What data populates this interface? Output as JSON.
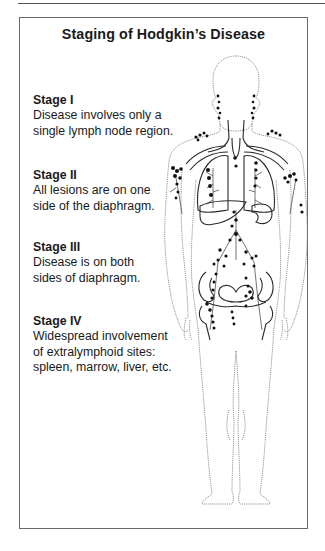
{
  "title": "Staging of Hodgkin’s Disease",
  "stages": [
    {
      "heading": "Stage I",
      "lines": [
        "Disease involves only a",
        "single lymph node region."
      ]
    },
    {
      "heading": "Stage II",
      "lines": [
        "All lesions are on one",
        "side of the diaphragm."
      ]
    },
    {
      "heading": "Stage III",
      "lines": [
        "Disease is on both",
        "sides of diaphragm."
      ]
    },
    {
      "heading": "Stage IV",
      "lines": [
        "Widespread involvement",
        "of extralymphoid sites:",
        "spleen, marrow, liver, etc."
      ]
    }
  ],
  "figure": {
    "colors": {
      "outline": "#8a8a8a",
      "vessel": "#2a2a2a",
      "node": "#111111"
    }
  }
}
